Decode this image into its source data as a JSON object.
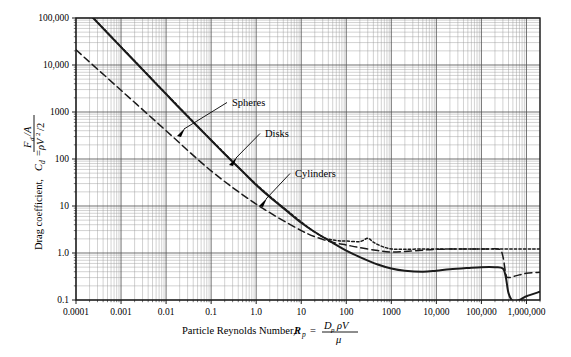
{
  "figure": {
    "title": "",
    "background_color": "#ffffff",
    "line_color": "#1a1a1a",
    "grid_major_color": "#555555",
    "grid_minor_color": "#9a9a9a"
  },
  "axes": {
    "x": {
      "label_text": "Particle Reynolds Number,",
      "label_symbol": "R",
      "label_symbol_sub": "p",
      "label_equals": "=",
      "label_frac_num": "D",
      "label_frac_num_sub": "p",
      "label_frac_num_rest": "ρV",
      "label_frac_den": "μ",
      "scale": "log",
      "min": 0.0001,
      "max": 2000000,
      "ticks": [
        {
          "value": 0.0001,
          "label": "0.0001"
        },
        {
          "value": 0.001,
          "label": "0.001"
        },
        {
          "value": 0.01,
          "label": "0.01"
        },
        {
          "value": 0.1,
          "label": "0.1"
        },
        {
          "value": 1,
          "label": "1.0"
        },
        {
          "value": 10,
          "label": "10"
        },
        {
          "value": 100,
          "label": "100"
        },
        {
          "value": 1000,
          "label": "1000"
        },
        {
          "value": 10000,
          "label": "10,000"
        },
        {
          "value": 100000,
          "label": "100,000"
        },
        {
          "value": 1000000,
          "label": "1,000,000"
        }
      ]
    },
    "y": {
      "label_text": "Drag coefficient,",
      "label_symbol": "C",
      "label_symbol_sub": "d",
      "label_equals": "=",
      "label_frac_num": "F",
      "label_frac_num_sub": "d",
      "label_frac_num_rest": "/A",
      "label_frac_den": "ρV",
      "label_frac_den_sup": "2",
      "label_frac_den_rest": "/2",
      "scale": "log",
      "min": 0.1,
      "max": 100000,
      "ticks": [
        {
          "value": 0.1,
          "label": "0.1"
        },
        {
          "value": 1,
          "label": "1.0"
        },
        {
          "value": 10,
          "label": "10"
        },
        {
          "value": 100,
          "label": "100"
        },
        {
          "value": 1000,
          "label": "1000"
        },
        {
          "value": 10000,
          "label": "10,000"
        },
        {
          "value": 100000,
          "label": "100,000"
        }
      ]
    }
  },
  "annotations": [
    {
      "name": "spheres",
      "label": "Spheres",
      "text_x": 232,
      "text_y": 106,
      "arrow_to_x": 180,
      "arrow_to_y": 133
    },
    {
      "name": "disks",
      "label": "Disks",
      "text_x": 265,
      "text_y": 137,
      "arrow_to_x": 232,
      "arrow_to_y": 162
    },
    {
      "name": "cylinders",
      "label": "Cylinders",
      "text_x": 295,
      "text_y": 177,
      "arrow_to_x": 262,
      "arrow_to_y": 203
    }
  ],
  "chart_data": {
    "type": "line",
    "title": "",
    "xlabel": "Particle Reynolds Number, R_p = D_p ρV / μ",
    "ylabel": "Drag coefficient, C_d = (F_d/A) / (ρV^2/2)",
    "xscale": "log",
    "yscale": "log",
    "xlim": [
      0.0001,
      2000000
    ],
    "ylim": [
      0.1,
      100000
    ],
    "grid": "major-and-minor-log",
    "legend_position": "inline-annotations",
    "series": [
      {
        "name": "Spheres",
        "style": "solid",
        "points": [
          [
            0.0001,
            240000
          ],
          [
            0.0002,
            120000
          ],
          [
            0.0005,
            48000
          ],
          [
            0.001,
            24000
          ],
          [
            0.002,
            12000
          ],
          [
            0.005,
            4800
          ],
          [
            0.01,
            2400
          ],
          [
            0.02,
            1200
          ],
          [
            0.05,
            490
          ],
          [
            0.1,
            250
          ],
          [
            0.2,
            128
          ],
          [
            0.5,
            54
          ],
          [
            1.0,
            28
          ],
          [
            2.0,
            15.5
          ],
          [
            5.0,
            7.6
          ],
          [
            10,
            4.4
          ],
          [
            20,
            2.8
          ],
          [
            50,
            1.65
          ],
          [
            100,
            1.12
          ],
          [
            200,
            0.82
          ],
          [
            500,
            0.57
          ],
          [
            1000,
            0.47
          ],
          [
            2000,
            0.42
          ],
          [
            5000,
            0.4
          ],
          [
            10000,
            0.42
          ],
          [
            20000,
            0.45
          ],
          [
            50000,
            0.48
          ],
          [
            100000,
            0.5
          ],
          [
            200000,
            0.5
          ],
          [
            300000,
            0.47
          ],
          [
            350000,
            0.3
          ],
          [
            400000,
            0.14
          ],
          [
            500000,
            0.095
          ],
          [
            700000,
            0.1
          ],
          [
            1000000,
            0.12
          ],
          [
            2000000,
            0.15
          ]
        ]
      },
      {
        "name": "Disks",
        "style": "dotted",
        "points": [
          [
            0.0001,
            245000
          ],
          [
            0.001,
            24500
          ],
          [
            0.01,
            2460
          ],
          [
            0.1,
            256
          ],
          [
            1.0,
            29
          ],
          [
            10,
            4.6
          ],
          [
            30,
            2.2
          ],
          [
            60,
            1.85
          ],
          [
            100,
            1.8
          ],
          [
            200,
            1.75
          ],
          [
            300,
            2.05
          ],
          [
            400,
            1.7
          ],
          [
            600,
            1.4
          ],
          [
            1000,
            1.22
          ],
          [
            2000,
            1.2
          ],
          [
            5000,
            1.22
          ],
          [
            10000,
            1.22
          ],
          [
            100000,
            1.22
          ],
          [
            1000000,
            1.22
          ],
          [
            2000000,
            1.22
          ]
        ]
      },
      {
        "name": "Cylinders",
        "style": "dashed",
        "points": [
          [
            0.0001,
            21000
          ],
          [
            0.001,
            2900
          ],
          [
            0.01,
            400
          ],
          [
            0.1,
            56
          ],
          [
            1.0,
            11.0
          ],
          [
            10,
            3.0
          ],
          [
            30,
            1.95
          ],
          [
            60,
            1.62
          ],
          [
            100,
            1.48
          ],
          [
            200,
            1.3
          ],
          [
            500,
            1.13
          ],
          [
            1000,
            1.05
          ],
          [
            2000,
            1.08
          ],
          [
            5000,
            1.15
          ],
          [
            10000,
            1.2
          ],
          [
            50000,
            1.22
          ],
          [
            150000,
            1.22
          ],
          [
            250000,
            1.2
          ],
          [
            300000,
            0.85
          ],
          [
            350000,
            0.35
          ],
          [
            400000,
            0.3
          ],
          [
            600000,
            0.33
          ],
          [
            1000000,
            0.37
          ],
          [
            2000000,
            0.39
          ]
        ]
      }
    ]
  }
}
